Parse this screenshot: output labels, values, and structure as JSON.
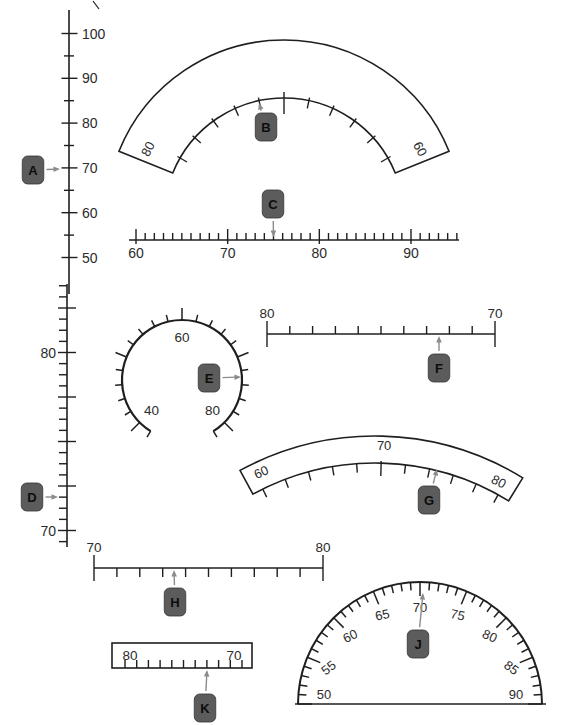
{
  "figure": {
    "background": "#ffffff",
    "ink": "#1f1f1f",
    "arrow_color": "#8c8c8c",
    "pointer_box_fill": "#5c5c5c",
    "pointer_box_stroke": "#333333",
    "width": 561,
    "height": 725
  },
  "scales": [
    {
      "id": "A",
      "type": "vruler",
      "x": 69,
      "y_top": 10,
      "y_bottom": 294,
      "anchor": {
        "v1": 100,
        "y1": 33.5,
        "v2": 50,
        "y2": 257.5
      },
      "ticks": {
        "min": 50,
        "max": 100,
        "step": 5,
        "major_mult": 10
      },
      "geom": {
        "minor": [
          -5,
          5
        ],
        "major": [
          -7.5,
          8.5
        ]
      },
      "labels": {
        "values": [
          100,
          90,
          80,
          70,
          60,
          50
        ],
        "side": "right",
        "dx": 13,
        "font": 14
      },
      "pointer": {
        "letter": "A",
        "reading": 70,
        "box": [
          33,
          170
        ],
        "tip": [
          60,
          169
        ]
      }
    },
    {
      "id": "B",
      "type": "arcband",
      "cx": 284,
      "cy": 218,
      "ro": 178,
      "ri": 120,
      "v0": 70,
      "aperv": -6,
      "ends": [
        -68,
        68
      ],
      "ticks": {
        "min": 60,
        "max": 80,
        "step": 2,
        "major_values": [
          70
        ]
      },
      "geom": {
        "minor": [
          3,
          -8
        ],
        "major": [
          6,
          -16
        ]
      },
      "labels": [
        {
          "text": "80",
          "v": 80.3,
          "r": 150,
          "rot": 1
        },
        {
          "text": "60",
          "v": 59.7,
          "r": 150,
          "rot": 1
        }
      ],
      "label_font": 13,
      "pointer": {
        "letter": "B",
        "reading": 72,
        "box": [
          266,
          127
        ],
        "tip": [
          259,
          103
        ]
      }
    },
    {
      "id": "C",
      "type": "hruler",
      "y": 240,
      "x_left": 129,
      "x_right": 459,
      "anchor": {
        "v1": 60,
        "x1": 136,
        "v2": 90,
        "x2": 411
      },
      "ticks": {
        "min": 60,
        "max": 95,
        "step": 1,
        "major_mult": 10
      },
      "geom": {
        "minor": [
          -7,
          0
        ],
        "major": [
          -11,
          4
        ]
      },
      "labels": {
        "values": [
          60,
          70,
          80,
          90
        ],
        "dy": 18,
        "font": 14
      },
      "pointer": {
        "letter": "C",
        "reading": 75,
        "box": [
          273,
          204
        ],
        "tip": [
          273.5,
          237
        ]
      }
    },
    {
      "id": "D",
      "type": "vruler",
      "x": 67,
      "y_top": 284,
      "y_bottom": 547,
      "anchor": {
        "v1": 80,
        "y1": 352.5,
        "v2": 70,
        "y2": 530.5
      },
      "ticks": {
        "min": 69.375,
        "max": 83.75,
        "step": 0.625,
        "major_mult": 2.5
      },
      "geom": {
        "minor": [
          -8,
          0
        ],
        "major": [
          -9,
          9
        ]
      },
      "labels": {
        "values": [
          80,
          70
        ],
        "side": "left",
        "dx": -11,
        "font": 14
      },
      "pointer": {
        "letter": "D",
        "reading": 72,
        "box": [
          32,
          497
        ],
        "tip": [
          58,
          497
        ]
      }
    },
    {
      "id": "E",
      "type": "circle",
      "cx": 182,
      "cy": 380,
      "r": 60,
      "v0": 60,
      "aperv": 6.75,
      "arc": [
        38,
        82
      ],
      "ticks": {
        "min": 38,
        "max": 82,
        "step": 2,
        "major_mult": 10
      },
      "geom": {
        "minor": [
          0,
          7
        ],
        "major": [
          0,
          12
        ]
      },
      "labels": [
        {
          "text": "60",
          "v": 60,
          "r": 43
        },
        {
          "text": "40",
          "v": 40,
          "r": 43
        },
        {
          "text": "80",
          "v": 80,
          "r": 43
        }
      ],
      "label_font": 13.5,
      "pointer": {
        "letter": "E",
        "reading": 73,
        "box": [
          209,
          378
        ],
        "tip": [
          241,
          377
        ]
      }
    },
    {
      "id": "F",
      "type": "hruler",
      "y": 334,
      "x_left": 267,
      "x_right": 495,
      "anchor": {
        "v1": 80,
        "x1": 267,
        "v2": 70,
        "x2": 495
      },
      "ticks": {
        "min": 70,
        "max": 80,
        "step": 1,
        "major_mult": 10
      },
      "geom": {
        "minor": [
          -8,
          0
        ],
        "major": [
          -13,
          13
        ]
      },
      "labels": {
        "values": [
          80,
          70
        ],
        "dy": -16,
        "font": 13.5
      },
      "pointer": {
        "letter": "F",
        "reading": 72.5,
        "box": [
          439,
          368
        ],
        "tip": [
          439,
          336
        ]
      }
    },
    {
      "id": "G",
      "type": "arcband",
      "cx": 375,
      "cy": 718,
      "ro": 282,
      "ri": 255,
      "v0": 69.5,
      "aperv": 2.75,
      "ends": [
        -28.6,
        31.6
      ],
      "ticks": {
        "min": 60,
        "max": 80,
        "step": 2,
        "major_values": [
          70
        ]
      },
      "geom": {
        "minor": [
          0,
          -9
        ],
        "major": [
          2,
          -13
        ]
      },
      "labels": [
        {
          "text": "60",
          "v": 60.6,
          "r": 270,
          "rot": 1
        },
        {
          "text": "70",
          "v": 70.2,
          "r": 272,
          "rot": 0
        },
        {
          "text": "80",
          "v": 79.4,
          "r": 266,
          "rot": 1
        }
      ],
      "label_font": 13,
      "pointer": {
        "letter": "G",
        "reading": 74.5,
        "box": [
          429,
          500
        ],
        "tip": [
          437,
          469
        ]
      }
    },
    {
      "id": "H",
      "type": "hruler",
      "y": 568,
      "x_left": 94,
      "x_right": 323,
      "anchor": {
        "v1": 70,
        "x1": 94,
        "v2": 80,
        "x2": 323
      },
      "ticks": {
        "min": 70,
        "max": 80,
        "step": 1,
        "major_mult": 10
      },
      "geom": {
        "minor": [
          0,
          9
        ],
        "major": [
          -13,
          13
        ]
      },
      "labels": {
        "values": [
          70,
          80
        ],
        "dy": -16,
        "font": 13.5
      },
      "pointer": {
        "letter": "H",
        "reading": 73.5,
        "box": [
          175,
          602
        ],
        "tip": [
          174,
          570
        ]
      }
    },
    {
      "id": "J",
      "type": "semi",
      "cx": 420,
      "cy": 704,
      "r": 122,
      "v0": 70,
      "aperv": 4.5,
      "base": [
        295,
        546
      ],
      "ticks": {
        "min": 50,
        "max": 90,
        "step": 1,
        "major_mult": 5
      },
      "geom": {
        "minor": [
          0,
          -8
        ],
        "major": [
          0,
          -14
        ]
      },
      "labels": {
        "values": [
          50,
          55,
          60,
          65,
          70,
          75,
          80,
          85,
          90
        ],
        "r_off": 26,
        "rot_factor": 0.55,
        "font": 13
      },
      "pointer": {
        "letter": "J",
        "reading": 70.5,
        "box": [
          418,
          644
        ],
        "tip": [
          423,
          593
        ]
      }
    },
    {
      "id": "K",
      "type": "boxruler",
      "x": 112,
      "y": 643,
      "w": 140,
      "h": 25,
      "anchor": {
        "v1": 80,
        "x1": 125,
        "v2": 70,
        "x2": 242
      },
      "ticks": {
        "min": 70,
        "max": 80,
        "step": 1
      },
      "tick_h": 8,
      "labels": [
        {
          "text": "80",
          "x": 130,
          "y": 660
        },
        {
          "text": "70",
          "x": 234,
          "y": 660
        }
      ],
      "label_font": 13.5,
      "pointer": {
        "letter": "K",
        "reading": 73,
        "box": [
          205,
          708
        ],
        "tip": [
          207,
          670
        ]
      }
    }
  ],
  "stray_mark": {
    "x1": 93,
    "y1": 1,
    "x2": 99,
    "y2": 9
  }
}
